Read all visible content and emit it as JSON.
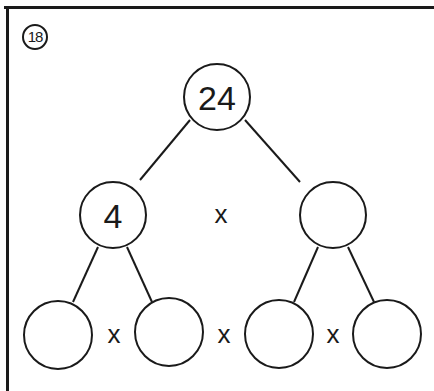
{
  "problem": {
    "number": "18"
  },
  "tree": {
    "root": {
      "value": "24"
    },
    "middle": [
      {
        "value": "4"
      },
      {
        "value": ""
      }
    ],
    "bottom": [
      {
        "value": ""
      },
      {
        "value": ""
      },
      {
        "value": ""
      },
      {
        "value": ""
      }
    ],
    "operators": {
      "middle": "x",
      "bottom": [
        "x",
        "x",
        "x"
      ]
    }
  },
  "colors": {
    "ink": "#1a1a1a",
    "background": "#ffffff"
  }
}
